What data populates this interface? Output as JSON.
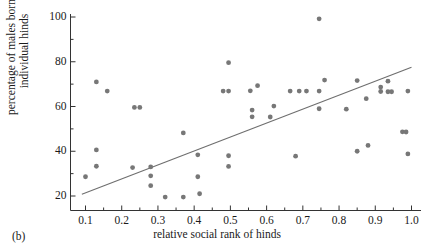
{
  "figure": {
    "panel_label": "(b)",
    "background_color": "#ffffff",
    "marker_color": "#777777",
    "line_color": "#6e6e6e",
    "axis_color": "#333333"
  },
  "chart_data": {
    "type": "scatter",
    "title": "",
    "xlabel": "relative social rank of hinds",
    "ylabel": "percentage of males born to individual hinds",
    "ylabel_lines": [
      "percentage of males born to",
      "individual hinds"
    ],
    "xlim": [
      0.06,
      1.03
    ],
    "ylim": [
      15,
      102
    ],
    "grid": false,
    "legend": null,
    "xticks": [
      0.1,
      0.2,
      0.3,
      0.4,
      0.5,
      0.6,
      0.7,
      0.8,
      0.9,
      1.0
    ],
    "xticklabels": [
      "0.1",
      "0.2",
      "0.3",
      "0.4",
      "0.5",
      "0.6",
      "0.7",
      "0.8",
      "0.9",
      "1.0"
    ],
    "xminorticks": [
      0.15,
      0.25,
      0.35,
      0.45,
      0.55,
      0.65,
      0.75,
      0.85,
      0.95
    ],
    "yticks": [
      20,
      40,
      60,
      80,
      100
    ],
    "yticklabels": [
      "20",
      "40",
      "60",
      "80",
      "100"
    ],
    "yminorticks": [
      30,
      50,
      70,
      90
    ],
    "trendline": {
      "x": [
        0.09,
        1.0
      ],
      "y": [
        20.8,
        77.5
      ]
    },
    "points": [
      {
        "x": 0.1,
        "y": 28.6
      },
      {
        "x": 0.13,
        "y": 71.0
      },
      {
        "x": 0.13,
        "y": 40.6
      },
      {
        "x": 0.13,
        "y": 33.3
      },
      {
        "x": 0.16,
        "y": 66.9
      },
      {
        "x": 0.23,
        "y": 32.7
      },
      {
        "x": 0.235,
        "y": 59.6
      },
      {
        "x": 0.25,
        "y": 59.6
      },
      {
        "x": 0.28,
        "y": 33.0
      },
      {
        "x": 0.28,
        "y": 29.0
      },
      {
        "x": 0.28,
        "y": 24.6
      },
      {
        "x": 0.32,
        "y": 19.5
      },
      {
        "x": 0.37,
        "y": 48.2
      },
      {
        "x": 0.37,
        "y": 19.5
      },
      {
        "x": 0.41,
        "y": 38.4
      },
      {
        "x": 0.41,
        "y": 28.6
      },
      {
        "x": 0.415,
        "y": 21.0
      },
      {
        "x": 0.48,
        "y": 66.9
      },
      {
        "x": 0.495,
        "y": 79.6
      },
      {
        "x": 0.495,
        "y": 66.9
      },
      {
        "x": 0.495,
        "y": 38.0
      },
      {
        "x": 0.495,
        "y": 33.2
      },
      {
        "x": 0.555,
        "y": 67.0
      },
      {
        "x": 0.56,
        "y": 58.4
      },
      {
        "x": 0.56,
        "y": 55.4
      },
      {
        "x": 0.575,
        "y": 69.3
      },
      {
        "x": 0.61,
        "y": 55.3
      },
      {
        "x": 0.62,
        "y": 60.2
      },
      {
        "x": 0.665,
        "y": 66.9
      },
      {
        "x": 0.68,
        "y": 37.8
      },
      {
        "x": 0.69,
        "y": 66.9
      },
      {
        "x": 0.71,
        "y": 66.9
      },
      {
        "x": 0.745,
        "y": 99.2
      },
      {
        "x": 0.745,
        "y": 66.9
      },
      {
        "x": 0.745,
        "y": 59.0
      },
      {
        "x": 0.76,
        "y": 71.8
      },
      {
        "x": 0.82,
        "y": 58.8
      },
      {
        "x": 0.85,
        "y": 71.6
      },
      {
        "x": 0.85,
        "y": 40.0
      },
      {
        "x": 0.875,
        "y": 63.5
      },
      {
        "x": 0.88,
        "y": 42.6
      },
      {
        "x": 0.915,
        "y": 68.7
      },
      {
        "x": 0.915,
        "y": 66.7
      },
      {
        "x": 0.935,
        "y": 71.3
      },
      {
        "x": 0.935,
        "y": 66.6
      },
      {
        "x": 0.945,
        "y": 66.6
      },
      {
        "x": 0.975,
        "y": 48.7
      },
      {
        "x": 0.985,
        "y": 48.6
      },
      {
        "x": 0.99,
        "y": 66.9
      },
      {
        "x": 0.99,
        "y": 38.8
      }
    ]
  }
}
